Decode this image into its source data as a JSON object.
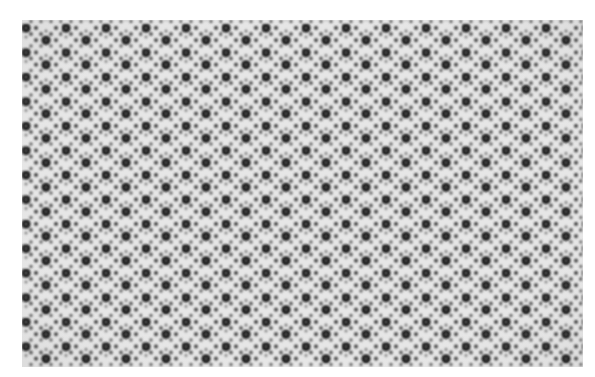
{
  "image": {
    "description": "Grayscale electron micrograph of a hexagonal/quasicrystalline lattice of dark atomic columns on light background",
    "colors": {
      "background": "#ffffff",
      "field": "#e4e4e4",
      "large_dot": "#141414",
      "small_dot": "#4a4a4a"
    }
  }
}
